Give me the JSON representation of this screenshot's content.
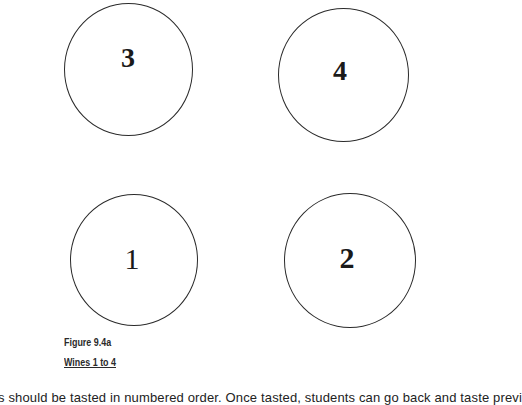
{
  "figure": {
    "circles": [
      {
        "label": "3",
        "position": "top-left"
      },
      {
        "label": "4",
        "position": "top-right"
      },
      {
        "label": "1",
        "position": "bottom-left"
      },
      {
        "label": "2",
        "position": "bottom-right"
      }
    ],
    "caption_title": "Figure 9.4a",
    "caption_subtitle": "Wines 1 to 4"
  },
  "body": {
    "text": "s should be tasted in numbered order. Once tasted, students can go back and taste previ"
  }
}
